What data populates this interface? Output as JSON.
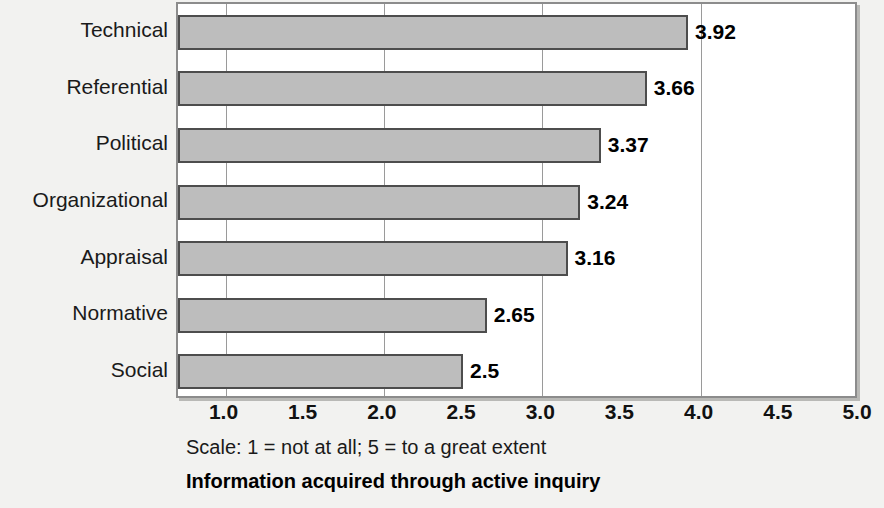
{
  "chart_data": {
    "type": "bar",
    "orientation": "horizontal",
    "title": "Information acquired through active inquiry",
    "subtitle": "Scale: 1 = not at all; 5 = to a great extent",
    "xlabel": "",
    "ylabel": "",
    "categories": [
      "Technical",
      "Referential",
      "Political",
      "Organizational",
      "Appraisal",
      "Normative",
      "Social"
    ],
    "values": [
      3.92,
      3.66,
      3.37,
      3.24,
      3.16,
      2.65,
      2.5
    ],
    "value_labels": [
      "3.92",
      "3.66",
      "3.37",
      "3.24",
      "3.16",
      "2.65",
      "2.5"
    ],
    "xlim": [
      0.7,
      5.0
    ],
    "bar_base": 0.7,
    "xticks": [
      1.0,
      1.5,
      2.0,
      2.5,
      3.0,
      3.5,
      4.0,
      4.5,
      5.0
    ],
    "xtick_labels": [
      "1.0",
      "1.5",
      "2.0",
      "2.5",
      "3.0",
      "3.5",
      "4.0",
      "4.5",
      "5.0"
    ],
    "gridlines": [
      1.0,
      2.0,
      3.0,
      4.0
    ],
    "grid": true,
    "legend": false,
    "bar_color": "#bdbdbd",
    "bar_border_color": "#4d4d4d",
    "plot_background": "#ffffff",
    "page_background": "#f2f2f0"
  }
}
